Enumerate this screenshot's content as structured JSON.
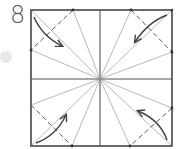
{
  "diagram": {
    "type": "origami-step",
    "step_number": "8",
    "colors": {
      "border": "#5a5a5a",
      "center_crease": "#8a8a8a",
      "radial_crease": "#b0b0b0",
      "dashed_fold": "#5a5a5a",
      "arrow": "#444444",
      "dot": "#333333",
      "blob": "#e6e6e6"
    },
    "elements": {
      "outer_square": "paper-outline",
      "center_creases": [
        "vertical-midline",
        "horizontal-midline"
      ],
      "radial_crease_targets": [
        "top-left-corner",
        "top-edge-left-point",
        "top-edge-right-point",
        "top-right-corner",
        "right-edge-upper-point",
        "right-edge-lower-point",
        "bottom-right-corner",
        "bottom-edge-right-point",
        "bottom-edge-left-point",
        "bottom-left-corner",
        "left-edge-lower-point",
        "left-edge-upper-point"
      ],
      "valley_folds": [
        "top-left-corner-fold",
        "top-right-corner-fold",
        "bottom-left-corner-fold",
        "bottom-right-corner-fold"
      ],
      "arrows": [
        {
          "name": "fold-arrow-top-left",
          "direction": "toward-center"
        },
        {
          "name": "fold-arrow-top-right",
          "direction": "toward-center"
        },
        {
          "name": "fold-arrow-bottom-left",
          "direction": "toward-center"
        },
        {
          "name": "fold-arrow-bottom-right",
          "direction": "toward-center"
        }
      ]
    }
  }
}
